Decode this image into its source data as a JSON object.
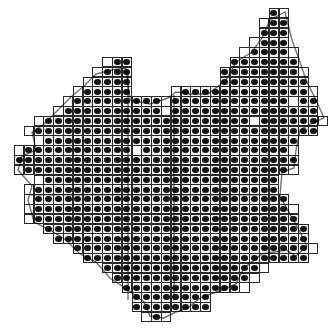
{
  "map": {
    "type": "distribution-grid-atlas",
    "grid": {
      "origin_x": 14,
      "origin_y": 8,
      "pitch": 9.8,
      "columns": 32,
      "rows": 33
    },
    "colors": {
      "background": "#ffffff",
      "cell_border": "#2a2a2a",
      "cell_fill": "#f2f2f2",
      "dot": "#111111",
      "boundary": "#000000"
    },
    "legend": {
      "filled_square": "record present (dot)",
      "open_square": "no record"
    },
    "rows": [
      {
        "row": 0,
        "ranges": [
          [
            26,
            27
          ]
        ]
      },
      {
        "row": 1,
        "ranges": [
          [
            25,
            27
          ]
        ]
      },
      {
        "row": 2,
        "ranges": [
          [
            25,
            27
          ]
        ]
      },
      {
        "row": 3,
        "ranges": [
          [
            24,
            27
          ]
        ]
      },
      {
        "row": 4,
        "ranges": [
          [
            23,
            28
          ]
        ]
      },
      {
        "row": 5,
        "ranges": [
          [
            9,
            11
          ],
          [
            22,
            28
          ]
        ]
      },
      {
        "row": 6,
        "ranges": [
          [
            8,
            11
          ],
          [
            21,
            29
          ]
        ]
      },
      {
        "row": 7,
        "ranges": [
          [
            7,
            11
          ],
          [
            21,
            29
          ]
        ]
      },
      {
        "row": 8,
        "ranges": [
          [
            6,
            11
          ],
          [
            16,
            30
          ]
        ]
      },
      {
        "row": 9,
        "ranges": [
          [
            5,
            30
          ]
        ]
      },
      {
        "row": 10,
        "ranges": [
          [
            4,
            30
          ]
        ]
      },
      {
        "row": 11,
        "ranges": [
          [
            2,
            31
          ]
        ]
      },
      {
        "row": 12,
        "ranges": [
          [
            1,
            30
          ]
        ]
      },
      {
        "row": 13,
        "ranges": [
          [
            2,
            28
          ]
        ]
      },
      {
        "row": 14,
        "ranges": [
          [
            0,
            28
          ]
        ]
      },
      {
        "row": 15,
        "ranges": [
          [
            0,
            28
          ]
        ]
      },
      {
        "row": 16,
        "ranges": [
          [
            0,
            28
          ]
        ]
      },
      {
        "row": 17,
        "ranges": [
          [
            2,
            26
          ]
        ]
      },
      {
        "row": 18,
        "ranges": [
          [
            1,
            26
          ]
        ]
      },
      {
        "row": 19,
        "ranges": [
          [
            1,
            27
          ]
        ]
      },
      {
        "row": 20,
        "ranges": [
          [
            1,
            28
          ]
        ]
      },
      {
        "row": 21,
        "ranges": [
          [
            1,
            28
          ]
        ]
      },
      {
        "row": 22,
        "ranges": [
          [
            3,
            29
          ]
        ]
      },
      {
        "row": 23,
        "ranges": [
          [
            4,
            29
          ]
        ]
      },
      {
        "row": 24,
        "ranges": [
          [
            6,
            30
          ]
        ]
      },
      {
        "row": 25,
        "ranges": [
          [
            7,
            29
          ]
        ]
      },
      {
        "row": 26,
        "ranges": [
          [
            9,
            25
          ]
        ]
      },
      {
        "row": 27,
        "ranges": [
          [
            10,
            24
          ]
        ]
      },
      {
        "row": 28,
        "ranges": [
          [
            11,
            23
          ]
        ]
      },
      {
        "row": 29,
        "ranges": [
          [
            12,
            19
          ]
        ]
      },
      {
        "row": 30,
        "ranges": [
          [
            12,
            19
          ]
        ]
      },
      {
        "row": 31,
        "ranges": [
          [
            13,
            15
          ]
        ]
      }
    ],
    "empty_cells": [
      [
        0,
        27
      ],
      [
        1,
        25
      ],
      [
        3,
        24
      ],
      [
        4,
        23
      ],
      [
        5,
        9
      ],
      [
        6,
        8
      ],
      [
        7,
        7
      ],
      [
        8,
        6
      ],
      [
        8,
        16
      ],
      [
        9,
        5
      ],
      [
        9,
        15
      ],
      [
        9,
        28
      ],
      [
        10,
        4
      ],
      [
        10,
        15
      ],
      [
        11,
        2
      ],
      [
        11,
        24
      ],
      [
        12,
        1
      ],
      [
        13,
        2
      ],
      [
        14,
        0
      ],
      [
        14,
        12
      ],
      [
        16,
        0
      ],
      [
        17,
        2
      ],
      [
        18,
        1
      ],
      [
        19,
        1
      ],
      [
        20,
        1
      ],
      [
        21,
        1
      ],
      [
        4,
        28
      ],
      [
        6,
        29
      ],
      [
        8,
        30
      ],
      [
        11,
        31
      ],
      [
        14,
        28
      ],
      [
        16,
        28
      ],
      [
        20,
        28
      ],
      [
        24,
        30
      ],
      [
        26,
        25
      ],
      [
        27,
        24
      ],
      [
        28,
        23
      ],
      [
        31,
        13
      ],
      [
        31,
        15
      ]
    ]
  }
}
